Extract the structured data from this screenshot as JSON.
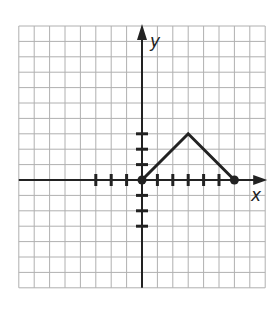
{
  "chart_data": {
    "type": "line",
    "title": "",
    "xlabel": "x",
    "ylabel": "y",
    "grid": true,
    "grid_extent": {
      "x_min": -8,
      "x_max": 8,
      "y_min": -7,
      "y_max": 10
    },
    "x_ticks_marked": [
      -3,
      -2,
      -1,
      1,
      2,
      3,
      4,
      5
    ],
    "y_ticks_marked": [
      -3,
      -2,
      -1,
      1,
      2,
      3
    ],
    "series": [
      {
        "name": "graph",
        "points": [
          [
            0,
            0
          ],
          [
            3,
            3
          ],
          [
            6,
            0
          ]
        ],
        "endpoints_closed": [
          [
            0,
            0
          ],
          [
            6,
            0
          ]
        ]
      }
    ]
  },
  "labels": {
    "x_axis": "x",
    "y_axis": "y"
  },
  "colors": {
    "grid": "#b0b0b0",
    "axis": "#222222",
    "line": "#222222"
  }
}
